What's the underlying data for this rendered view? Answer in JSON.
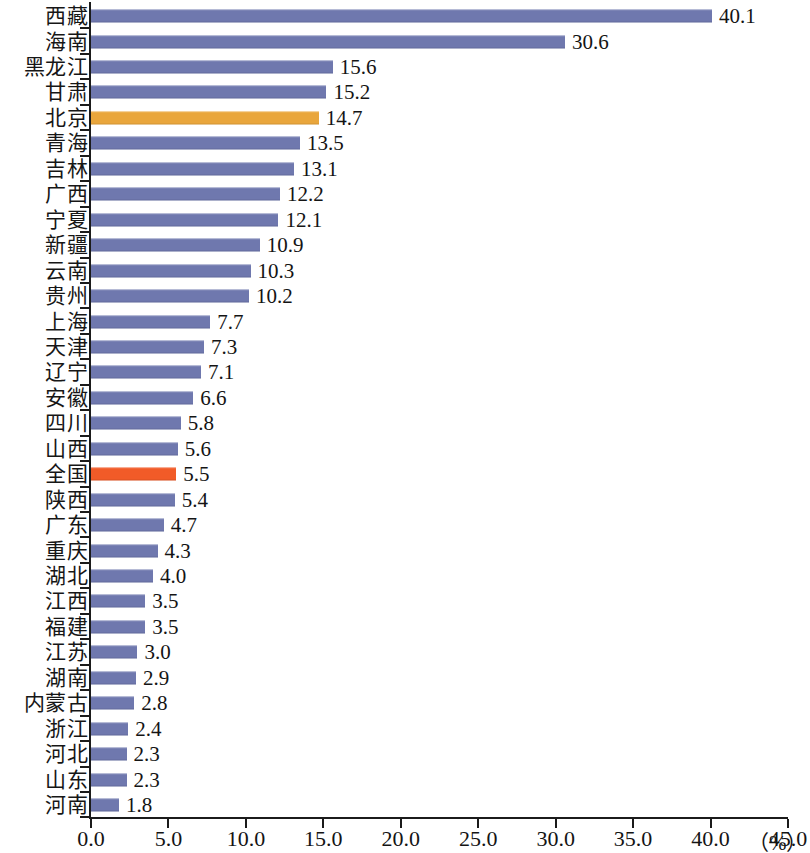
{
  "chart_data": {
    "type": "bar",
    "orientation": "horizontal",
    "title": "",
    "subtitle": "",
    "xlabel": "",
    "ylabel": "",
    "unit_label": "（%）",
    "xlim": [
      0.0,
      45.0
    ],
    "xticks": [
      "0.0",
      "5.0",
      "10.0",
      "15.0",
      "20.0",
      "25.0",
      "30.0",
      "35.0",
      "40.0",
      "45.0"
    ],
    "xtick_values": [
      0,
      5,
      10,
      15,
      20,
      25,
      30,
      35,
      40,
      45
    ],
    "grid": false,
    "legend": "none",
    "series_color": "#6f78ae",
    "highlight_colors": {
      "beijing": "#e9a63c",
      "national": "#f15b28"
    },
    "categories": [
      "西藏",
      "海南",
      "黑龙江",
      "甘肃",
      "北京",
      "青海",
      "吉林",
      "广西",
      "宁夏",
      "新疆",
      "云南",
      "贵州",
      "上海",
      "天津",
      "辽宁",
      "安徽",
      "四川",
      "山西",
      "全国",
      "陕西",
      "广东",
      "重庆",
      "湖北",
      "江西",
      "福建",
      "江苏",
      "湖南",
      "内蒙古",
      "浙江",
      "河北",
      "山东",
      "河南"
    ],
    "values": [
      40.1,
      30.6,
      15.6,
      15.2,
      14.7,
      13.5,
      13.1,
      12.2,
      12.1,
      10.9,
      10.3,
      10.2,
      7.7,
      7.3,
      7.1,
      6.6,
      5.8,
      5.6,
      5.5,
      5.4,
      4.7,
      4.3,
      4.0,
      3.5,
      3.5,
      3.0,
      2.9,
      2.8,
      2.4,
      2.3,
      2.3,
      1.8
    ],
    "value_labels": [
      "40.1",
      "30.6",
      "15.6",
      "15.2",
      "14.7",
      "13.5",
      "13.1",
      "12.2",
      "12.1",
      "10.9",
      "10.3",
      "10.2",
      "7.7",
      "7.3",
      "7.1",
      "6.6",
      "5.8",
      "5.6",
      "5.5",
      "5.4",
      "4.7",
      "4.3",
      "4.0",
      "3.5",
      "3.5",
      "3.0",
      "2.9",
      "2.8",
      "2.4",
      "2.3",
      "2.3",
      "1.8"
    ],
    "bar_styles": [
      "normal",
      "normal",
      "normal",
      "normal",
      "orange",
      "normal",
      "normal",
      "normal",
      "normal",
      "normal",
      "normal",
      "normal",
      "normal",
      "normal",
      "normal",
      "normal",
      "normal",
      "normal",
      "red",
      "normal",
      "normal",
      "normal",
      "normal",
      "normal",
      "normal",
      "normal",
      "normal",
      "normal",
      "normal",
      "normal",
      "normal",
      "normal"
    ]
  }
}
